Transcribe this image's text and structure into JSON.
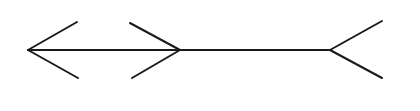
{
  "diagram": {
    "kind": "muller-lyer-illusion",
    "stroke_color": "#1a1a1a",
    "stroke_width": 2,
    "background": "#ffffff",
    "shaft": {
      "x1": 28,
      "y1": 50,
      "x2": 330,
      "y2": 50
    },
    "segments": [
      {
        "name": "left-arrowhead-upper",
        "x1": 28,
        "y1": 50,
        "x2": 77,
        "y2": 22
      },
      {
        "name": "left-arrowhead-lower",
        "x1": 28,
        "y1": 50,
        "x2": 78,
        "y2": 78
      },
      {
        "name": "middle-arrowhead-upper",
        "x1": 130,
        "y1": 23,
        "x2": 180,
        "y2": 50
      },
      {
        "name": "middle-arrowhead-lower",
        "x1": 132,
        "y1": 78,
        "x2": 180,
        "y2": 50
      },
      {
        "name": "right-fin-upper",
        "x1": 330,
        "y1": 50,
        "x2": 382,
        "y2": 21
      },
      {
        "name": "right-fin-lower",
        "x1": 330,
        "y1": 50,
        "x2": 382,
        "y2": 78
      }
    ]
  }
}
